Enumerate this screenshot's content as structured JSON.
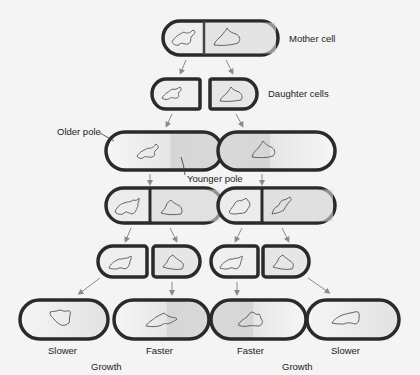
{
  "labels": {
    "mother_cell": "Mother cell",
    "daughter_cells": "Daughter cells",
    "older_pole": "Older pole",
    "younger_pole": "Younger pole",
    "bottom_left_outer": "Slower",
    "bottom_left_inner": "Faster",
    "bottom_right_inner": "Faster",
    "bottom_right_outer": "Slower",
    "growth_left": "Growth",
    "growth_right": "Growth"
  },
  "colors": {
    "background": "#f4f4f4",
    "cell_wall": "#2a2a2a",
    "cell_fill_light": "#f2f2f2",
    "cell_fill_dark": "#d4d4d4",
    "arrow": "#888888",
    "nucleoid": "#555555"
  },
  "generations": [
    {
      "name": "mother",
      "cells": 1,
      "divided": true
    },
    {
      "name": "daughters",
      "cells": 2,
      "divided": false
    },
    {
      "name": "elongated",
      "cells": 2,
      "divided": false
    },
    {
      "name": "dividing",
      "cells": 2,
      "divided": true
    },
    {
      "name": "granddaughters",
      "cells": 4,
      "divided": false
    },
    {
      "name": "elongated-granddaughters",
      "cells": 4,
      "divided": false
    }
  ]
}
